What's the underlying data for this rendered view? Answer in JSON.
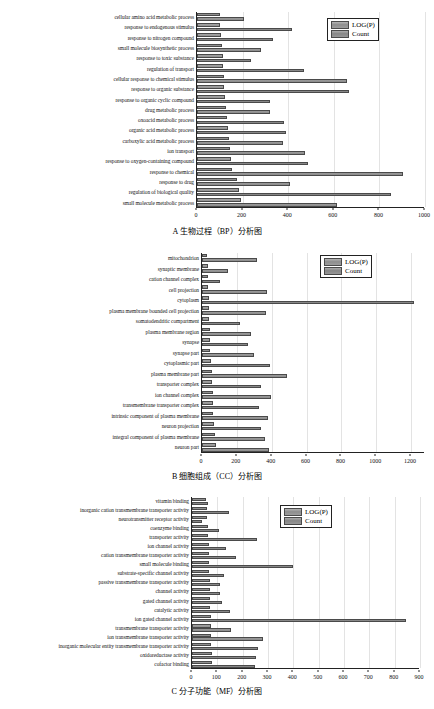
{
  "figure": {
    "legend": {
      "logp_label": "LOG(P)",
      "count_label": "Count"
    }
  },
  "panels": [
    {
      "id": "panel-a",
      "caption": "A  生物过程（BP）分析图",
      "chart_data": {
        "type": "bar",
        "orientation": "horizontal",
        "title": "A  生物过程（BP）分析图",
        "xlabel": "",
        "ylabel": "",
        "xlim": [
          0,
          1000
        ],
        "xticks": [
          0,
          200,
          400,
          600,
          800,
          1000
        ],
        "grid": true,
        "legend_position": "top-right",
        "categories": [
          "cellular amino acid metabolic process",
          "response to endogenous stimulus",
          "response to nitrogen compound",
          "small molecule biosynthetic process",
          "response to toxic substance",
          "regulation of transport",
          "cellular response to chemical stimulus",
          "response to organic substance",
          "response to organic cyclic compound",
          "drug metabolic process",
          "oxoacid metabolic process",
          "organic acid metabolic process",
          "carboxylic acid metabolic process",
          "ion transport",
          "response to oxygen-containing compound",
          "response to chemical",
          "response to drug",
          "regulation of biological quality",
          "small molecule metabolic process"
        ],
        "series": [
          {
            "name": "LOG(P)",
            "values": [
              100,
              103,
              106,
              110,
              112,
              115,
              118,
              120,
              122,
              128,
              132,
              136,
              140,
              145,
              150,
              155,
              175,
              185,
              195
            ]
          },
          {
            "name": "Count",
            "values": [
              205,
              415,
              335,
              282,
              238,
              468,
              660,
              665,
              320,
              318,
              380,
              392,
              378,
              472,
              486,
              905,
              410,
              850,
              612
            ]
          }
        ]
      }
    },
    {
      "id": "panel-b",
      "caption": "B  细胞组成（CC）分析图",
      "chart_data": {
        "type": "bar",
        "orientation": "horizontal",
        "title": "B  细胞组成（CC）分析图",
        "xlabel": "",
        "ylabel": "",
        "xlim": [
          0,
          1280
        ],
        "xticks": [
          0,
          200,
          400,
          600,
          800,
          1000,
          1200
        ],
        "grid": true,
        "legend_position": "top-right",
        "categories": [
          "mitochondrion",
          "synaptic membrane",
          "cation channel complex",
          "cell projection",
          "cytoplasm",
          "plasma membrane bounded cell projection",
          "somatodendritic compartment",
          "plasma membrane region",
          "synapse",
          "synapse part",
          "cytoplasmic part",
          "plasma membrane part",
          "transporter complex",
          "ion channel complex",
          "transmembrane transporter complex",
          "intrinsic component of plasma membrane",
          "neuron projection",
          "integral component of plasma membrane",
          "neuron part"
        ],
        "series": [
          {
            "name": "LOG(P)",
            "values": [
              30,
              32,
              34,
              36,
              38,
              40,
              42,
              44,
              46,
              48,
              52,
              56,
              60,
              62,
              64,
              66,
              70,
              74,
              78
            ]
          },
          {
            "name": "Count",
            "values": [
              318,
              150,
              105,
              372,
              1218,
              368,
              218,
              280,
              262,
              300,
              392,
              486,
              340,
              398,
              330,
              380,
              340,
              360,
              382
            ]
          }
        ]
      }
    },
    {
      "id": "panel-c",
      "caption": "C  分子功能（MF）分析图",
      "chart_data": {
        "type": "bar",
        "orientation": "horizontal",
        "title": "C  分子功能（MF）分析图",
        "xlabel": "",
        "ylabel": "",
        "xlim": [
          0,
          900
        ],
        "xticks": [
          0,
          100,
          200,
          300,
          400,
          500,
          600,
          700,
          800,
          900
        ],
        "grid": true,
        "legend_position": "top-right",
        "categories": [
          "vitamin binding",
          "inorganic cation transmembrane transporter activity",
          "neurotransmitter receptor activity",
          "coenzyme binding",
          "transporter activity",
          "ion channel activity",
          "cation transmembrane transporter activity",
          "small molecule binding",
          "substrate-specific channel activity",
          "passive transmembrane transporter activity",
          "channel activity",
          "gated channel activity",
          "catalytic activity",
          "ion gated channel activity",
          "transmembrane transporter activity",
          "ion transmembrane transporter activity",
          "inorganic molecular entity transmembrane transporter activity",
          "oxidoreductase activity",
          "cofactor binding"
        ],
        "series": [
          {
            "name": "LOG(P)",
            "values": [
              55,
              58,
              60,
              62,
              64,
              66,
              66,
              68,
              68,
              70,
              70,
              72,
              72,
              74,
              74,
              76,
              76,
              78,
              78
            ]
          },
          {
            "name": "Count",
            "values": [
              62,
              148,
              40,
              105,
              258,
              135,
              175,
              398,
              125,
              110,
              112,
              118,
              150,
              845,
              152,
              280,
              262,
              252,
              248
            ]
          }
        ]
      }
    }
  ]
}
